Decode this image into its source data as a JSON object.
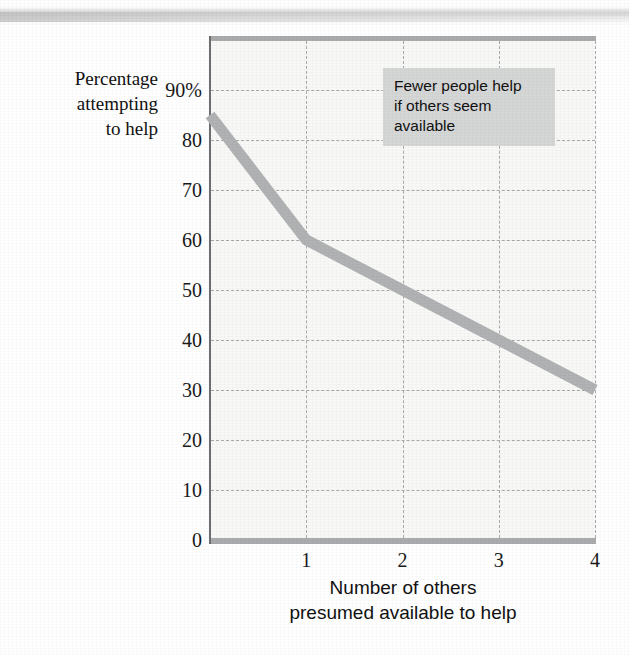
{
  "figure": {
    "background_color": "#ffffff",
    "plot_background_color": "#f8f8f7",
    "line_color": "#b0b2b3",
    "grid_color": "#a8a9aa",
    "axis_color": "#a9abac",
    "callout_background_color": "#d5d6d6",
    "text_color": "#111111"
  },
  "ylabel_lines": [
    "Percentage",
    "attempting",
    "to help"
  ],
  "xlabel_lines": [
    "Number of others",
    "presumed available to help"
  ],
  "callout_lines": [
    "Fewer people help",
    "if others seem",
    "available"
  ],
  "chart_data": {
    "type": "line",
    "title": "",
    "subtitle": "",
    "xlabel": "Number of others presumed available to help",
    "ylabel": "Percentage attempting to help",
    "xlim": [
      0,
      4
    ],
    "ylim": [
      0,
      95
    ],
    "xticks": [
      0,
      1,
      2,
      3,
      4
    ],
    "xticklabels": [
      "",
      "1",
      "2",
      "3",
      "4"
    ],
    "yticks": [
      0,
      10,
      20,
      30,
      40,
      50,
      60,
      70,
      80,
      90
    ],
    "yticklabels": [
      "0",
      "10",
      "20",
      "30",
      "40",
      "50",
      "60",
      "70",
      "80",
      "90%"
    ],
    "grid": true,
    "grid_style": "dashed",
    "legend": false,
    "legend_position": "none",
    "annotations": [
      {
        "text": "Fewer people help if others seem available",
        "x": 1.75,
        "y": 88
      }
    ],
    "series": [
      {
        "name": "Percentage attempting to help",
        "x": [
          0,
          1,
          2,
          3,
          4
        ],
        "values": [
          85,
          60,
          50,
          40,
          30
        ]
      }
    ]
  }
}
